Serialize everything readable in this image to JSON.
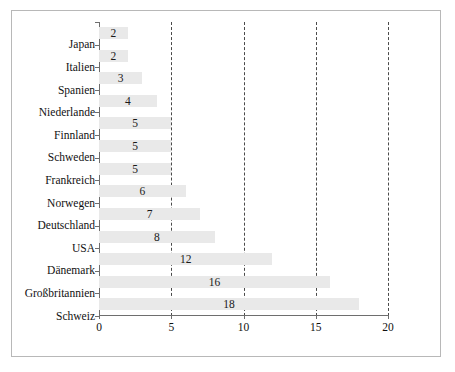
{
  "chart_data": {
    "type": "bar",
    "orientation": "horizontal",
    "title": "",
    "subtitle": "",
    "xlabel": "",
    "ylabel": "",
    "categories": [
      "Japan",
      "Italien",
      "Spanien",
      "Niederlande",
      "Finnland",
      "Schweden",
      "Frankreich",
      "Norwegen",
      "Deutschland",
      "USA",
      "Dänemark",
      "Großbritannien",
      "Schweiz"
    ],
    "values": [
      2,
      2,
      3,
      4,
      5,
      5,
      5,
      6,
      7,
      8,
      12,
      16,
      18
    ],
    "value_labels": [
      "2",
      "2",
      "3",
      "4",
      "5",
      "5",
      "5",
      "6",
      "7",
      "8",
      "12",
      "16",
      "18"
    ],
    "xlim": [
      0,
      20
    ],
    "xticks": [
      0,
      5,
      10,
      15,
      20
    ],
    "xtick_labels": [
      "0",
      "5",
      "10",
      "15",
      "20"
    ],
    "grid": {
      "vertical": true,
      "style": "dashed",
      "at": [
        5,
        10,
        15,
        20
      ],
      "color": "#4a4a4a"
    },
    "legend": null,
    "bar_color": "#e9e9e9",
    "axis_color": "#6e6e6e",
    "frame_color": "#b8b8b8",
    "text_color": "#111111"
  }
}
